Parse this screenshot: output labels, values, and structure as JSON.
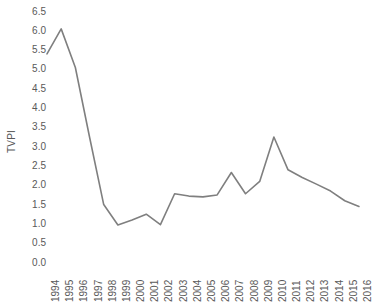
{
  "chart_data": {
    "type": "line",
    "title": "",
    "xlabel": "",
    "ylabel": "TVPI",
    "categories": [
      "1994",
      "1995",
      "1996",
      "1997",
      "1998",
      "1999",
      "2000",
      "2001",
      "2002",
      "2003",
      "2004",
      "2005",
      "2006",
      "2007",
      "2008",
      "2009",
      "2010",
      "2011",
      "2012",
      "2013",
      "2014",
      "2015",
      "2016"
    ],
    "values": [
      5.4,
      6.05,
      5.05,
      3.25,
      1.5,
      0.97,
      1.1,
      1.25,
      0.98,
      1.78,
      1.72,
      1.7,
      1.75,
      2.33,
      1.78,
      2.1,
      3.25,
      2.4,
      2.2,
      2.03,
      1.85,
      1.6,
      1.45
    ],
    "series": [
      {
        "name": "TVPI",
        "values": [
          5.4,
          6.05,
          5.05,
          3.25,
          1.5,
          0.97,
          1.1,
          1.25,
          0.98,
          1.78,
          1.72,
          1.7,
          1.75,
          2.33,
          1.78,
          2.1,
          3.25,
          2.4,
          2.2,
          2.03,
          1.85,
          1.6,
          1.45
        ]
      }
    ],
    "ylim": [
      0.0,
      6.5
    ],
    "ytick_step": 0.5,
    "yticks": [
      "6.5",
      "6.0",
      "5.5",
      "5.0",
      "4.5",
      "4.0",
      "3.5",
      "3.0",
      "2.5",
      "2.0",
      "1.5",
      "1.0",
      "0.5",
      "0.0"
    ],
    "grid": false,
    "legend": false,
    "line_color": "#7f7f7f",
    "text_color": "#595959",
    "background": "#ffffff"
  }
}
